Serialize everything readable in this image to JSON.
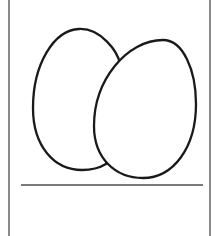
{
  "card": {
    "subject": "eggs",
    "illustration_label": "Two eggs",
    "answer_text": "",
    "colors": {
      "border": "#8a8a8a",
      "outline": "#1a1a1a",
      "fill": "#ffffff",
      "line": "#7a7a7a"
    }
  }
}
